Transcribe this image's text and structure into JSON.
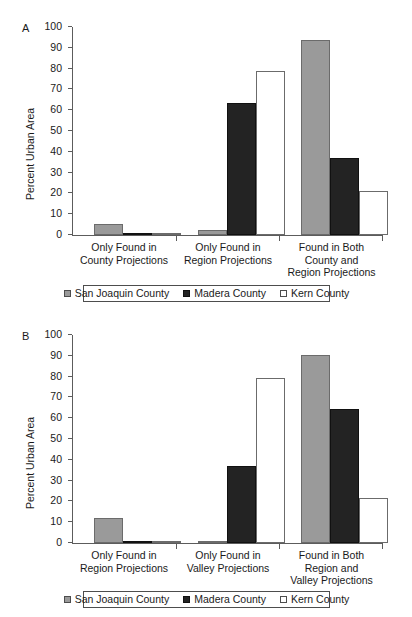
{
  "figure": {
    "background": "#ffffff",
    "panels": [
      {
        "letter": "A",
        "ylabel": "Percent Urban Area",
        "yticks": [
          "0",
          "10",
          "20",
          "30",
          "40",
          "50",
          "60",
          "70",
          "80",
          "90",
          "100"
        ],
        "categories": [
          "Only Found in\nCounty Projections",
          "Only Found in\nRegion Projections",
          "Found in Both\nCounty and\nRegion Projections"
        ],
        "legend": [
          "San Joaquin County",
          "Madera County",
          "Kern County"
        ]
      },
      {
        "letter": "B",
        "ylabel": "Percent Urban Area",
        "yticks": [
          "0",
          "10",
          "20",
          "30",
          "40",
          "50",
          "60",
          "70",
          "80",
          "90",
          "100"
        ],
        "categories": [
          "Only Found in\nRegion Projections",
          "Only Found in\nValley Projections",
          "Found in Both\nRegion and\nValley Projections"
        ],
        "legend": [
          "San Joaquin County",
          "Madera County",
          "Kern County"
        ]
      }
    ]
  },
  "chart_data": [
    {
      "type": "bar",
      "panel": "A",
      "title": "",
      "xlabel": "",
      "ylabel": "Percent Urban Area",
      "ylim": [
        0,
        100
      ],
      "ytick_step": 10,
      "grid": false,
      "legend_position": "bottom",
      "categories": [
        "Only Found in County Projections",
        "Only Found in Region Projections",
        "Found in Both County and Region Projections"
      ],
      "series": [
        {
          "name": "San Joaquin County",
          "color": "#9a9a9a",
          "values": [
            4.7,
            2.1,
            93.8
          ]
        },
        {
          "name": "Madera County",
          "color": "#232323",
          "values": [
            0.5,
            63.4,
            36.8
          ]
        },
        {
          "name": "Kern County",
          "color": "#ffffff",
          "values": [
            0.0,
            78.7,
            21.0
          ]
        }
      ]
    },
    {
      "type": "bar",
      "panel": "B",
      "title": "",
      "xlabel": "",
      "ylabel": "Percent Urban Area",
      "ylim": [
        0,
        100
      ],
      "ytick_step": 10,
      "grid": false,
      "legend_position": "bottom",
      "categories": [
        "Only Found in Region Projections",
        "Only Found in Valley Projections",
        "Found in Both Region and Valley Projections"
      ],
      "series": [
        {
          "name": "San Joaquin County",
          "color": "#9a9a9a",
          "values": [
            11.4,
            0.0,
            90.2
          ]
        },
        {
          "name": "Madera County",
          "color": "#232323",
          "values": [
            0.6,
            36.9,
            64.4
          ]
        },
        {
          "name": "Kern County",
          "color": "#ffffff",
          "values": [
            0.0,
            79.1,
            21.8
          ]
        }
      ]
    }
  ]
}
